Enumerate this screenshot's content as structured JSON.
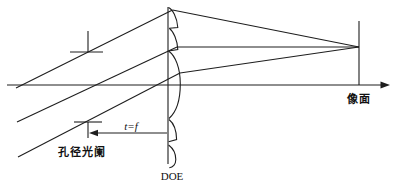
{
  "diagram": {
    "background": "#ffffff",
    "line_color": "#1e1e1e",
    "labels": {
      "aperture_stop": "孔径光阑",
      "stop_to_doe_distance": "t=f",
      "doe": "DOE",
      "image_plane": "像面"
    }
  }
}
